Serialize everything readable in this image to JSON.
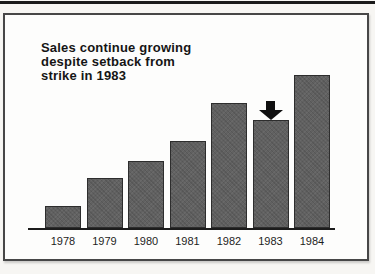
{
  "page": {
    "background_color": "#f7f6f3",
    "top_rule_color": "#1a1a1a",
    "frame_border_color": "#474747",
    "frame_background_color": "#fdfdfc"
  },
  "chart_data": {
    "type": "bar",
    "title": "Sales continue growing despite setback from strike in 1983",
    "title_lines": [
      "Sales continue growing",
      "despite setback from",
      "strike in 1983"
    ],
    "categories": [
      "1978",
      "1979",
      "1980",
      "1981",
      "1982",
      "1983",
      "1984"
    ],
    "values": [
      22,
      50,
      67,
      87,
      125,
      108,
      153
    ],
    "xlabel": "",
    "ylabel": "",
    "ylim": [
      0,
      160
    ],
    "grid": false,
    "legend": null,
    "bar_color": "#616161",
    "bar_border_color": "#2d2d2d",
    "axis_line_color": "#1c1c1c",
    "title_color": "#151515",
    "annotation": {
      "type": "arrow-down",
      "target_category": "1983",
      "color": "#101010"
    }
  }
}
